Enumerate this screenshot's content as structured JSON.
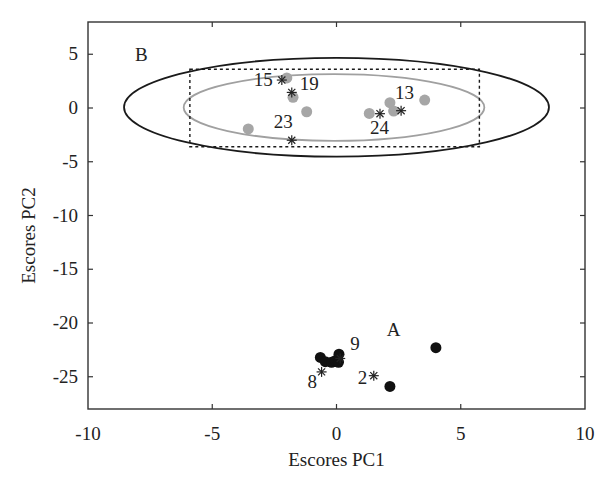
{
  "chart_data": {
    "type": "scatter",
    "title": "",
    "xlabel": "Escores PC1",
    "ylabel": "Escores PC2",
    "xlim": [
      -10,
      10
    ],
    "ylim": [
      -28,
      8
    ],
    "xticks": [
      -10,
      -5,
      0,
      5,
      10
    ],
    "yticks": [
      5,
      0,
      -5,
      -10,
      -15,
      -20,
      -25
    ],
    "xtick_labels": [
      "-10",
      "-5",
      "0",
      "5",
      "10"
    ],
    "ytick_labels": [
      "5",
      "0",
      "-5",
      "-10",
      "-15",
      "-20",
      "-25"
    ],
    "grid": false,
    "legend": null,
    "series": [
      {
        "name": "Group B (gray circles)",
        "marker": "circle",
        "color": "#a6a6a6",
        "points": [
          {
            "x": -2.0,
            "y": 2.8
          },
          {
            "x": -1.75,
            "y": 1.0
          },
          {
            "x": -1.2,
            "y": -0.35
          },
          {
            "x": -3.55,
            "y": -1.95
          },
          {
            "x": 1.32,
            "y": -0.5
          },
          {
            "x": 2.15,
            "y": 0.5
          },
          {
            "x": 2.3,
            "y": -0.28
          },
          {
            "x": 3.55,
            "y": 0.74
          }
        ]
      },
      {
        "name": "Group A (black circles)",
        "marker": "circle",
        "color": "#111111",
        "points": [
          {
            "x": -0.65,
            "y": -23.2
          },
          {
            "x": -0.45,
            "y": -23.6
          },
          {
            "x": -0.2,
            "y": -23.65
          },
          {
            "x": -0.05,
            "y": -23.5
          },
          {
            "x": 0.08,
            "y": -23.65
          },
          {
            "x": 0.1,
            "y": -22.9
          },
          {
            "x": 4.0,
            "y": -22.3
          },
          {
            "x": 2.15,
            "y": -25.9
          }
        ]
      },
      {
        "name": "Labeled samples (asterisks)",
        "marker": "asterisk",
        "color": "#222222",
        "points": [
          {
            "x": -2.2,
            "y": 2.6,
            "label": "15",
            "label_dx": -28,
            "label_dy": 6
          },
          {
            "x": -1.8,
            "y": 1.45,
            "label": "19",
            "label_dx": 8,
            "label_dy": -2
          },
          {
            "x": -1.8,
            "y": -3.0,
            "label": "23",
            "label_dx": -18,
            "label_dy": -12
          },
          {
            "x": 1.75,
            "y": -0.53,
            "label": "24",
            "label_dx": -10,
            "label_dy": 20
          },
          {
            "x": 2.6,
            "y": -0.25,
            "label": "13",
            "label_dx": -6,
            "label_dy": -12
          },
          {
            "x": 0.15,
            "y": -23.3,
            "label": "9",
            "label_dx": 10,
            "label_dy": -8
          },
          {
            "x": -0.6,
            "y": -24.55,
            "label": "8",
            "label_dx": -14,
            "label_dy": 16
          },
          {
            "x": 1.5,
            "y": -24.9,
            "label": "2",
            "label_dx": -16,
            "label_dy": 8
          }
        ]
      }
    ],
    "shapes": [
      {
        "type": "ellipse",
        "name": "outer-confidence-ellipse",
        "cx": 0.0,
        "cy": 0.07,
        "rx": 8.55,
        "ry": 4.6,
        "stroke": "#1a1a1a",
        "dash": false
      },
      {
        "type": "ellipse",
        "name": "inner-confidence-ellipse",
        "cx": -0.1,
        "cy": 0.05,
        "rx": 6.05,
        "ry": 3.1,
        "stroke": "#a0a0a0",
        "dash": false
      },
      {
        "type": "rect",
        "name": "dashed-bounding-box",
        "x0": -5.9,
        "x1": 5.75,
        "y0": -3.6,
        "y1": 3.6,
        "stroke": "#1a1a1a",
        "dash": true
      }
    ],
    "annotations": [
      {
        "text": "B",
        "x": -7.85,
        "y": 4.4
      },
      {
        "text": "A",
        "x": 2.3,
        "y": -21.2
      }
    ]
  },
  "plot": {
    "left": 88,
    "right": 585,
    "top": 22,
    "bottom": 409
  }
}
